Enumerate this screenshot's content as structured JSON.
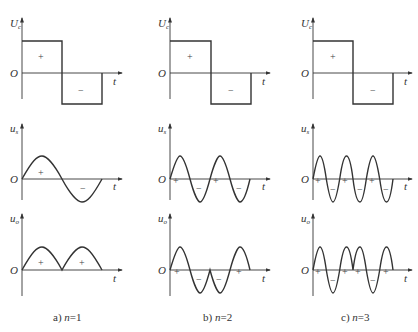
{
  "figure": {
    "columns": [
      {
        "caption_prefix": "a) ",
        "caption_var": "n",
        "caption_suffix": "=1",
        "n": 1
      },
      {
        "caption_prefix": "b) ",
        "caption_var": "n",
        "caption_suffix": "=2",
        "n": 2
      },
      {
        "caption_prefix": "c) ",
        "caption_var": "n",
        "caption_suffix": "=3",
        "n": 3
      }
    ],
    "rows": [
      {
        "ylabel": "U",
        "ylabel_sub": "c",
        "xlabel": "t",
        "origin": "O"
      },
      {
        "ylabel": "u",
        "ylabel_sub": "s",
        "xlabel": "t",
        "origin": "O"
      },
      {
        "ylabel": "u",
        "ylabel_sub": "o",
        "xlabel": "t",
        "origin": "O"
      }
    ],
    "signs": {
      "plus": "+",
      "minus": "−"
    },
    "colors": {
      "line": "#333333",
      "background": "#ffffff"
    }
  }
}
